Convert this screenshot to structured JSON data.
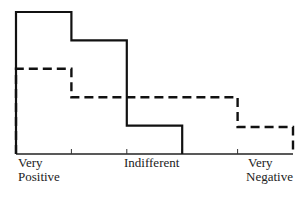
{
  "chart_data": {
    "type": "line",
    "subtype": "step-histogram",
    "title": "",
    "xlabel": "",
    "ylabel": "",
    "categories": [
      "1",
      "2",
      "3",
      "4",
      "5"
    ],
    "axis_labels": {
      "left": [
        "Very",
        "Positive"
      ],
      "middle": [
        "Indifferent"
      ],
      "right": [
        "Very",
        "Negative"
      ]
    },
    "series": [
      {
        "name": "solid",
        "style": "solid",
        "values": [
          100,
          80,
          20,
          0,
          0
        ]
      },
      {
        "name": "dashed",
        "style": "dashed",
        "values": [
          60,
          40,
          40,
          40,
          19
        ]
      }
    ],
    "ylim": [
      0,
      100
    ],
    "grid": false,
    "legend": "none",
    "colors": {
      "line": "#111111",
      "background": "#ffffff"
    }
  },
  "labels": {
    "left_line1": "Very",
    "left_line2": "Positive",
    "middle": "Indifferent",
    "right_line1": "Very",
    "right_line2": "Negative"
  }
}
